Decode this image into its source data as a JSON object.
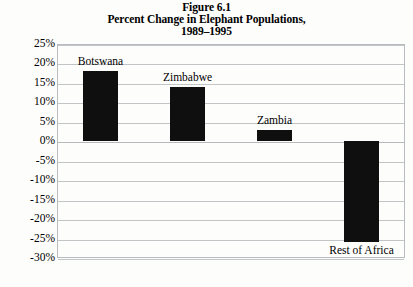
{
  "figure": {
    "title_lines": [
      "Figure 6.1",
      "Percent Change in Elephant Populations,",
      "1989–1995"
    ]
  },
  "chart_data": {
    "type": "bar",
    "title": "Figure 6.1 Percent Change in Elephant Populations, 1989–1995",
    "subtitle": "1989–1995",
    "categories": [
      "Botswana",
      "Zimbabwe",
      "Zambia",
      "Rest of Africa"
    ],
    "values": [
      18,
      14,
      3,
      -26
    ],
    "xlabel": "",
    "ylabel": "",
    "ylim": [
      -30,
      25
    ],
    "ytick_values": [
      25,
      20,
      15,
      10,
      5,
      0,
      -5,
      -10,
      -15,
      -20,
      -25,
      -30
    ],
    "ytick_labels": [
      "25%",
      "20%",
      "15%",
      "10%",
      "5%",
      "0%",
      "-5%",
      "-10%",
      "-15%",
      "-20%",
      "-25%",
      "-30%"
    ],
    "grid": true,
    "legend": false,
    "bar_color": "#100f0f",
    "grid_color": "#c2c5c7",
    "label_positions": [
      "above",
      "above",
      "above",
      "below"
    ]
  }
}
